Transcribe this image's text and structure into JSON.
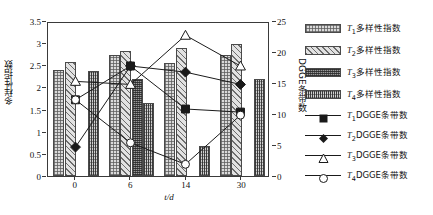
{
  "chart_data": {
    "type": "bar",
    "title": "",
    "xlabel": "t/d",
    "ylabel": "多样性指数",
    "ylabel_right": "DGGE条带数",
    "categories": [
      "0",
      "6",
      "14",
      "30"
    ],
    "ylim": [
      0,
      3.5
    ],
    "yticks": [
      "0",
      "0.5",
      "1",
      "1.5",
      "2",
      "2.5",
      "3",
      "3.5"
    ],
    "ylim_right": [
      0,
      25
    ],
    "yticks_right": [
      "0",
      "5",
      "10",
      "15",
      "20",
      "25"
    ],
    "xticks": [
      "0",
      "6",
      "14",
      "30"
    ],
    "grid": false,
    "legend_position": "right",
    "bar_series": [
      {
        "name": "T1多样性指数",
        "key": "t1",
        "fill": "fill-t1",
        "values": [
          2.4,
          2.73,
          2.55,
          2.73
        ]
      },
      {
        "name": "T2多样性指数",
        "key": "t2",
        "fill": "fill-t2",
        "values": [
          2.58,
          2.82,
          2.9,
          2.97
        ]
      },
      {
        "name": "T3多样性指数",
        "key": "t3",
        "fill": "fill-t3",
        "values": [
          0.0,
          2.18,
          0.0,
          0.0
        ]
      },
      {
        "name": "T4多样性指数",
        "key": "t4",
        "fill": "fill-t4",
        "values": [
          2.37,
          1.65,
          0.67,
          2.2
        ]
      }
    ],
    "line_series": [
      {
        "name": "T1DGGE条带数",
        "key": "l1",
        "marker": "square",
        "values": [
          12.5,
          18.0,
          11.0,
          10.5
        ]
      },
      {
        "name": "T2DGGE条带数",
        "key": "l2",
        "marker": "diamond",
        "values": [
          4.8,
          18.0,
          17.0,
          15.0
        ]
      },
      {
        "name": "T3DGGE条带数",
        "key": "l3",
        "marker": "triangle",
        "values": [
          15.5,
          15.0,
          23.0,
          18.0
        ]
      },
      {
        "name": "T4DGGE条带数",
        "key": "l4",
        "marker": "circle",
        "values": [
          12.5,
          5.5,
          2.0,
          10.0
        ]
      }
    ]
  },
  "legend": {
    "bars": [
      {
        "label_prefix": "T",
        "sub": "1",
        "label_rest": "多样性指数"
      },
      {
        "label_prefix": "T",
        "sub": "2",
        "label_rest": "多样性指数"
      },
      {
        "label_prefix": "T",
        "sub": "3",
        "label_rest": "多样性指数"
      },
      {
        "label_prefix": "T",
        "sub": "4",
        "label_rest": "多样性指数"
      }
    ],
    "lines": [
      {
        "label_prefix": "T",
        "sub": "1",
        "label_rest": "DGGE条带数"
      },
      {
        "label_prefix": "T",
        "sub": "2",
        "label_rest": "DGGE条带数"
      },
      {
        "label_prefix": "T",
        "sub": "3",
        "label_rest": "DGGE条带数"
      },
      {
        "label_prefix": "T",
        "sub": "4",
        "label_rest": "DGGE条带数"
      }
    ]
  },
  "colors": {
    "axis": "#3a3a3a",
    "line": "#1a1a1a",
    "text": "#111111"
  }
}
